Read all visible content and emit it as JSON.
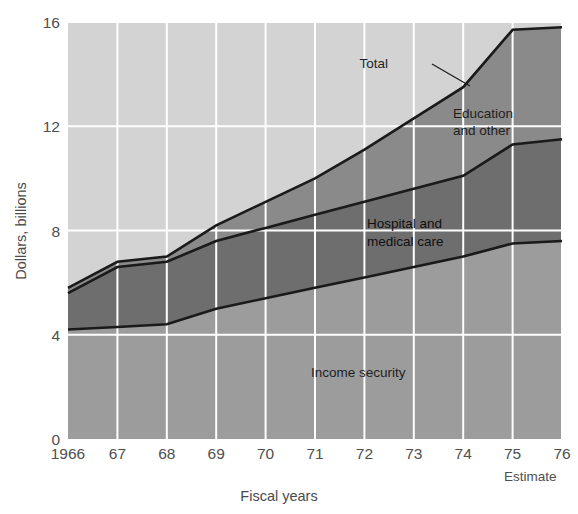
{
  "chart_data": {
    "type": "area",
    "stacked": true,
    "title": "",
    "xlabel": "Fiscal years",
    "ylabel": "Dollars, billions",
    "x": [
      1966,
      1967,
      1968,
      1969,
      1970,
      1971,
      1972,
      1973,
      1974,
      1975,
      1976
    ],
    "tick_labels": [
      "1966",
      "67",
      "68",
      "69",
      "70",
      "71",
      "72",
      "73",
      "74",
      "75",
      "76"
    ],
    "ylim": [
      0,
      16
    ],
    "yticks": [
      0,
      4,
      8,
      12,
      16
    ],
    "ytick_labels": [
      "0",
      "4",
      "8",
      "12",
      "16"
    ],
    "grid": true,
    "grid_color": "#ffffff",
    "annotations": [
      {
        "text": "Estimate",
        "note": "under 75-76 tick marks"
      }
    ],
    "series": [
      {
        "name": "Income security",
        "color": "#9c9c9c",
        "values": [
          4.2,
          4.3,
          4.4,
          5.0,
          5.4,
          5.8,
          6.2,
          6.6,
          7.0,
          7.5,
          7.6
        ]
      },
      {
        "name": "Hospital and medical care",
        "color": "#6e6e6e",
        "values": [
          1.4,
          2.3,
          2.4,
          2.6,
          2.7,
          2.8,
          2.9,
          3.0,
          3.1,
          3.8,
          3.9
        ],
        "cumulative": [
          5.6,
          6.6,
          6.8,
          7.6,
          8.1,
          8.6,
          9.1,
          9.6,
          10.1,
          11.3,
          11.5
        ]
      },
      {
        "name": "Education and other",
        "color": "#8a8a8a",
        "values": [
          0.2,
          0.2,
          0.2,
          0.6,
          1.0,
          1.4,
          2.0,
          2.7,
          3.4,
          4.4,
          4.3
        ],
        "cumulative": [
          5.8,
          6.8,
          7.0,
          8.2,
          9.1,
          10.0,
          11.1,
          12.3,
          13.5,
          15.7,
          15.8
        ]
      }
    ],
    "total": {
      "name": "Total",
      "values": [
        5.8,
        6.8,
        7.0,
        8.2,
        9.1,
        10.0,
        11.1,
        12.3,
        13.5,
        15.7,
        15.8
      ]
    },
    "legend_position": "inline-annotations"
  },
  "labels": {
    "total": "Total",
    "education": "Education",
    "education_line2": "and other",
    "hospital": "Hospital and",
    "hospital_line2": "medical care",
    "income": "Income security",
    "estimate": "Estimate",
    "y_axis_title": "Dollars, billions",
    "x_axis_title": "Fiscal years"
  }
}
